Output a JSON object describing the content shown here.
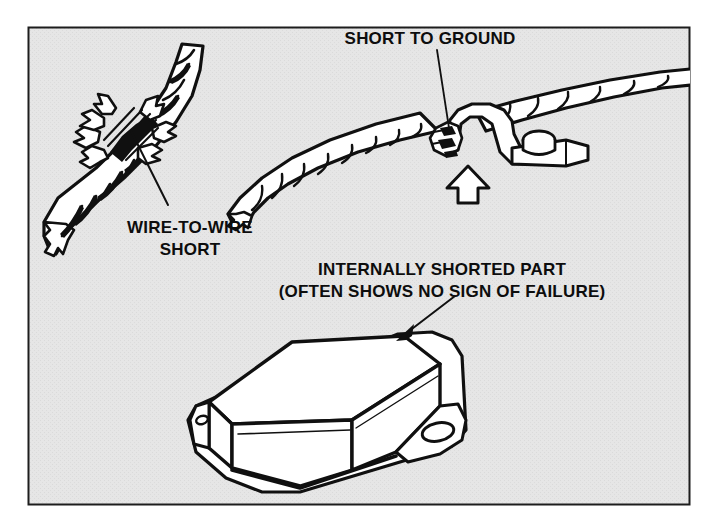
{
  "figure": {
    "panel": {
      "background_color": "#e3e3e3",
      "border_color": "#1a1a1a",
      "outer_background_color": "#ffffff",
      "x": 28,
      "y": 27,
      "width": 662,
      "height": 478
    },
    "ink_color": "#101010",
    "paper_color": "#ffffff"
  },
  "callouts": [
    {
      "id": "short-to-ground",
      "lines": [
        "SHORT TO GROUND"
      ],
      "anchor_x": 430,
      "anchor_y": 44,
      "align": "middle"
    },
    {
      "id": "wire-to-wire-short",
      "lines": [
        "WIRE-TO-WIRE",
        "SHORT"
      ],
      "anchor_x": 190,
      "anchor_y": 233,
      "align": "middle"
    },
    {
      "id": "internally-shorted-part",
      "lines": [
        "INTERNALLY SHORTED PART",
        "(OFTEN SHOWS NO SIGN OF FAILURE)"
      ],
      "anchor_x": 442,
      "anchor_y": 275,
      "align": "middle"
    }
  ],
  "illustrations": [
    {
      "id": "wire-to-wire-harness",
      "label": "Diagonal taped wire harness with chafed insulation exposing bare conductors"
    },
    {
      "id": "grounded-harness-clamp",
      "label": "Spiral-wrapped harness pinched in a bolted metal P-clamp"
    },
    {
      "id": "shorted-module-box",
      "label": "Rectangular electronic module with mounting flanges and bolt holes"
    }
  ],
  "markers": [
    {
      "id": "ground-short-arrow",
      "type": "hollow-block-arrow",
      "direction": "up",
      "points_to": "chafe point at clamp"
    },
    {
      "id": "module-leader-arrow",
      "type": "solid-arrowhead",
      "direction": "down-left",
      "points_to": "module top face"
    }
  ]
}
